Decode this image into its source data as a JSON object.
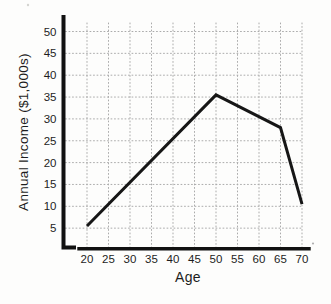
{
  "figure": {
    "background": "#fdfdfc"
  },
  "chart_data": {
    "type": "line",
    "title": "",
    "xlabel": "Age",
    "ylabel": "Annual Income ($1,000s)",
    "x_ticks": [
      20,
      25,
      30,
      35,
      40,
      45,
      50,
      55,
      60,
      65,
      70
    ],
    "y_ticks": [
      5,
      10,
      15,
      20,
      25,
      30,
      35,
      40,
      45,
      50
    ],
    "xlim": [
      20,
      70
    ],
    "ylim": [
      0,
      52
    ],
    "grid": "dotted",
    "legend": "none",
    "series": [
      {
        "name": "annual-income-by-age",
        "points": [
          [
            20,
            5.5
          ],
          [
            50,
            35.5
          ],
          [
            65,
            28
          ],
          [
            70,
            10.5
          ]
        ]
      }
    ],
    "colors": {
      "line": "#161616",
      "axis": "#111111",
      "grid": "#ababab",
      "text": "#1d1d1d"
    }
  }
}
